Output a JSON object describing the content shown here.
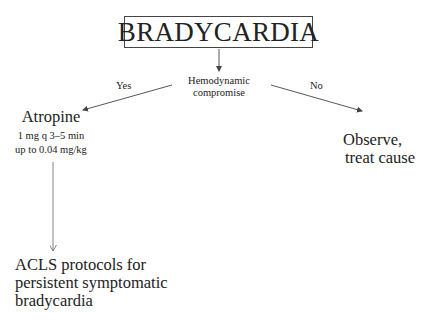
{
  "diagram": {
    "title": "BRADYCARDIA",
    "decision": {
      "line1": "Hemodynamic",
      "line2": "compromise"
    },
    "branches": {
      "yes": {
        "label": "Yes",
        "node": {
          "title": "Atropine",
          "dose_line1": "1 mg q 3–5 min",
          "dose_line2": "up to 0.04 mg/kg"
        },
        "next": {
          "line1": "ACLS protocols for",
          "line2": "persistent symptomatic",
          "line3": "bradycardia"
        }
      },
      "no": {
        "label": "No",
        "node": {
          "line1": "Observe,",
          "line2": "treat cause"
        }
      }
    },
    "colors": {
      "text": "#222222",
      "lines": "#444444",
      "background": "#ffffff"
    }
  }
}
